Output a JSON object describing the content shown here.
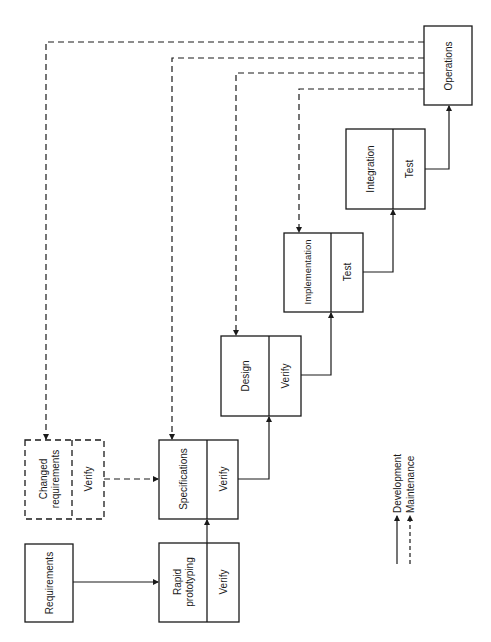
{
  "diagram": {
    "type": "rapid-prototyping-life-cycle",
    "nodes": {
      "requirements": {
        "label": "Requirements"
      },
      "changed_requirements": {
        "label_line1": "Changed",
        "label_line2": "requirements",
        "verify": "Verify"
      },
      "rapid_prototyping": {
        "label_line1": "Rapid",
        "label_line2": "prototyping",
        "verify": "Verify"
      },
      "specifications": {
        "label": "Specifications",
        "verify": "Verify"
      },
      "design": {
        "label": "Design",
        "verify": "Verify"
      },
      "implementation": {
        "label": "Implementation",
        "verify": "Test"
      },
      "integration": {
        "label": "Integration",
        "verify": "Test"
      },
      "operations": {
        "label": "Operations"
      }
    },
    "legend": {
      "development": "Development",
      "maintenance": "Maintenance"
    }
  },
  "colors": {
    "line": "#1a1a1a",
    "background": "#ffffff"
  }
}
